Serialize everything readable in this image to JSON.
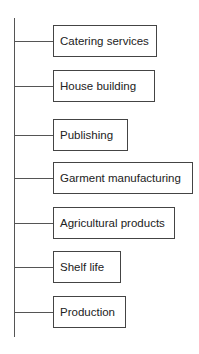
{
  "diagram": {
    "type": "tree",
    "items": [
      {
        "label": "Catering services",
        "top": 25,
        "width": 104
      },
      {
        "label": "House building",
        "top": 70,
        "width": 102
      },
      {
        "label": "Publishing",
        "top": 119,
        "width": 75
      },
      {
        "label": "Garment manufacturing",
        "top": 162,
        "width": 140
      },
      {
        "label": "Agricultural products",
        "top": 207,
        "width": 122
      },
      {
        "label": "Shelf life",
        "top": 251,
        "width": 68
      },
      {
        "label": "Production",
        "top": 296,
        "width": 73
      }
    ],
    "colors": {
      "line": "#555555",
      "border": "#444444",
      "text": "#222222"
    }
  }
}
